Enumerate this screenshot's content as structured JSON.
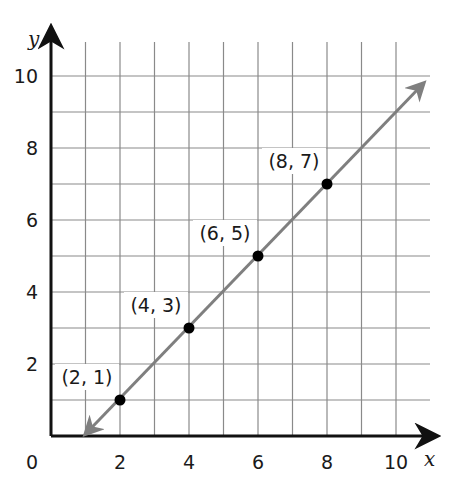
{
  "chart_data": {
    "type": "line",
    "title": "",
    "xlabel": "x",
    "ylabel": "y",
    "xlim": [
      0,
      11
    ],
    "ylim": [
      0,
      11
    ],
    "grid": true,
    "origin_label": "0",
    "x_ticks": [
      2,
      4,
      6,
      8,
      10
    ],
    "y_ticks": [
      2,
      4,
      6,
      8,
      10
    ],
    "x_tick_labels": [
      "2",
      "4",
      "6",
      "8",
      "10"
    ],
    "y_tick_labels": [
      "2",
      "4",
      "6",
      "8",
      "10"
    ],
    "line": {
      "equation": "y = x - 1",
      "start": [
        1,
        0
      ],
      "end": [
        10.8,
        9.8
      ],
      "arrows": "both",
      "color": "#7f7f7f"
    },
    "points": [
      {
        "x": 2,
        "y": 1,
        "label": "(2, 1)"
      },
      {
        "x": 4,
        "y": 3,
        "label": "(4, 3)"
      },
      {
        "x": 6,
        "y": 5,
        "label": "(6, 5)"
      },
      {
        "x": 8,
        "y": 7,
        "label": "(8, 7)"
      }
    ],
    "series": [
      {
        "name": "y = x - 1",
        "x": [
          2,
          4,
          6,
          8
        ],
        "y": [
          1,
          3,
          5,
          7
        ]
      }
    ],
    "colors": {
      "axis": "#111111",
      "grid": "#8a8a8a",
      "line": "#7f7f7f",
      "point": "#000000"
    }
  }
}
